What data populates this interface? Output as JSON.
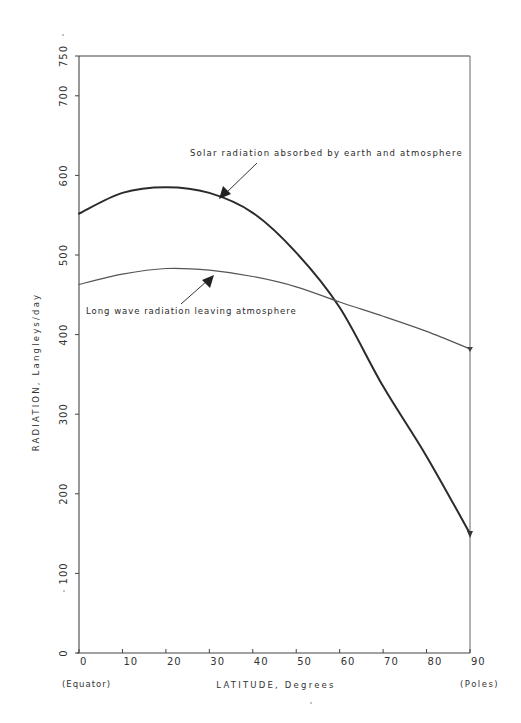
{
  "chart_data": {
    "type": "line",
    "title": "",
    "xlabel": "LATITUDE, Degrees",
    "ylabel": "RADIATION, Langleys/day",
    "x": [
      0,
      10,
      20,
      30,
      40,
      50,
      60,
      70,
      80,
      90
    ],
    "xlim": [
      0,
      90
    ],
    "ylim": [
      0,
      750
    ],
    "x_ticks": [
      "0",
      "10",
      "20",
      "30",
      "40",
      "50",
      "60",
      "70",
      "80",
      "90"
    ],
    "y_ticks": [
      "0",
      "100",
      "200",
      "300",
      "400",
      "500",
      "600",
      "700",
      "750"
    ],
    "x_tick_values": [
      0,
      10,
      20,
      30,
      40,
      50,
      60,
      70,
      80,
      90
    ],
    "y_tick_values": [
      0,
      100,
      200,
      300,
      400,
      500,
      600,
      700,
      750
    ],
    "x_end_labels": {
      "left": "(Equator)",
      "right": "(Poles)"
    },
    "grid": false,
    "legend": "none (curves labeled with arrow annotations)",
    "series": [
      {
        "name": "Solar radiation absorbed by earth and atmosphere",
        "values": [
          552,
          578,
          585,
          578,
          553,
          503,
          434,
          335,
          247,
          150
        ],
        "stroke": "#2b2b2b",
        "width": 2.0
      },
      {
        "name": "Long wave radiation leaving atmosphere",
        "values": [
          463,
          476,
          483,
          481,
          473,
          460,
          441,
          423,
          404,
          382
        ],
        "stroke": "#555555",
        "width": 1.2
      }
    ],
    "annotations": [
      {
        "text": "Solar radiation absorbed by earth and atmosphere",
        "arrow_target_x": 32,
        "arrow_target_y": 573,
        "label_x": 190,
        "label_y": 156
      },
      {
        "text": "Long wave radiation leaving atmosphere",
        "arrow_target_x": 31,
        "arrow_target_y": 477,
        "label_x": 86,
        "label_y": 314
      }
    ],
    "crossover": {
      "latitude": 58,
      "value": 445
    }
  },
  "labels": {
    "x_axis_title": "LATITUDE, Degrees",
    "y_axis_title": "RADIATION, Langleys/day",
    "equator": "(Equator)",
    "poles": "(Poles)",
    "solar_annotation": "Solar radiation absorbed by earth and atmosphere",
    "longwave_annotation": "Long wave radiation leaving atmosphere"
  }
}
